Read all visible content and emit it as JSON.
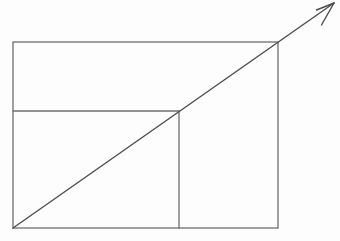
{
  "canvas": {
    "width": 340,
    "height": 241,
    "background": "#fdfdfd",
    "view_box": "0 0 340 241"
  },
  "diagram": {
    "kind": "geometric-figure",
    "line_color": "#6f6f6f",
    "arrow_color": "#4d4d4d",
    "outer_rect": {
      "x": 13,
      "y": 42,
      "width": 265,
      "height": 186
    },
    "inner_hline": {
      "x1": 13,
      "y1": 111,
      "x2": 179,
      "y2": 111
    },
    "inner_vline": {
      "x1": 179,
      "y1": 111,
      "x2": 179,
      "y2": 228
    },
    "arrow_shaft": {
      "x1": 13,
      "y1": 228,
      "x2": 334,
      "y2": 3
    },
    "arrow_barb_upper": {
      "x1": 334,
      "y1": 3,
      "x2": 316.5,
      "y2": 10
    },
    "arrow_barb_lower": {
      "x1": 334,
      "y1": 3,
      "x2": 321.5,
      "y2": 25
    }
  }
}
